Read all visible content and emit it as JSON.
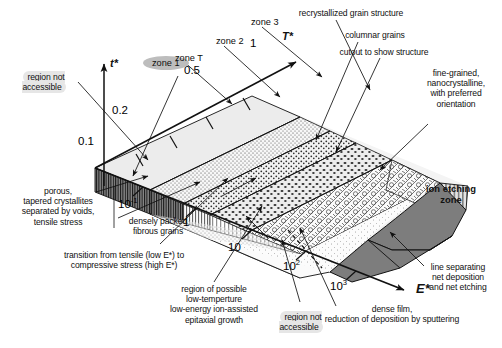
{
  "figure": {
    "type": "diagram"
  },
  "axes": {
    "vertical": {
      "symbol": "t*",
      "name": "t-star-axis"
    },
    "upper_right": {
      "symbol": "T*",
      "name": "T-star-axis"
    },
    "lower_right": {
      "symbol": "E*",
      "name": "E-star-axis"
    },
    "t_ticks": [
      "0.1",
      "0.2",
      "0.5",
      "1"
    ],
    "e_ticks": [
      {
        "mantissa": "10",
        "exp": "-1"
      },
      {
        "mantissa": "1",
        "exp": ""
      },
      {
        "mantissa": "10",
        "exp": ""
      },
      {
        "mantissa": "10",
        "exp": "2"
      },
      {
        "mantissa": "10",
        "exp": "3"
      }
    ]
  },
  "zones": {
    "zone1": "zone 1",
    "zoneT": "zone T",
    "zone2": "zone 2",
    "zone3": "zone 3",
    "ion_etching": "ion etching\nzone"
  },
  "annotations": {
    "region_not_accessible_left": "region not\naccessible",
    "region_not_accessible_bottom": "region not\naccessible",
    "porous": "porous,\ntapered crystallites\nseparated by voids,\ntensile stress",
    "densely_packed": "densely packed\nfibrous grains",
    "transition": "transition from tensile (low E*) to\ncompressive stress (high E*)",
    "epitaxial": "region of possible\nlow-temperture\nlow-energy ion-assisted\nepitaxial growth",
    "recrystallized": "recrystallized grain structure",
    "columnar": "columnar grains",
    "cutout": "cutout to show structure",
    "fine_grained": "fine-grained,\nnanocrystalline,\nwith preferred\norientation",
    "line_separating": "line separating\nnet deposition\nand net etching",
    "dense_film": "dense film,\nreduction of deposition by sputtering"
  },
  "colors": {
    "ink": "#111111",
    "ion_zone_fill": "#7d7d7d",
    "highlight": "#e6e6e6",
    "zone1_pill": "#bdbdbd",
    "top_plane": "#efefef",
    "base_plane": "#f5f5f5"
  }
}
